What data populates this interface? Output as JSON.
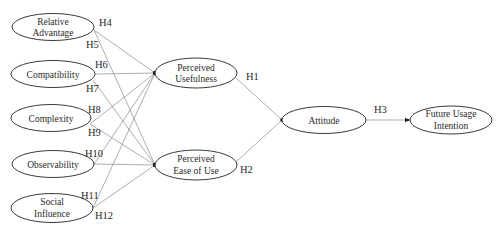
{
  "diagram": {
    "type": "structural-model",
    "colors": {
      "stroke": "#3a3a3a",
      "edge": "#8a8a8a",
      "text": "#2a2a2a",
      "background": "#ffffff"
    },
    "nodes": {
      "relative_advantage": {
        "lines": [
          "Relative",
          "Advantage"
        ]
      },
      "compatibility": {
        "lines": [
          "Compatibility"
        ]
      },
      "complexity": {
        "lines": [
          "Complexity"
        ]
      },
      "observability": {
        "lines": [
          "Observability"
        ]
      },
      "social_influence": {
        "lines": [
          "Social",
          "Influence"
        ]
      },
      "perceived_usefulness": {
        "lines": [
          "Perceived",
          "Usefulness"
        ]
      },
      "perceived_ease_of_use": {
        "lines": [
          "Perceived",
          "Ease of Use"
        ]
      },
      "attitude": {
        "lines": [
          "Attitude"
        ]
      },
      "future_usage_intention": {
        "lines": [
          "Future Usage",
          "Intention"
        ]
      }
    },
    "hypotheses": {
      "h1": "H1",
      "h2": "H2",
      "h3": "H3",
      "h4": "H4",
      "h5": "H5",
      "h6": "H6",
      "h7": "H7",
      "h8": "H8",
      "h9": "H9",
      "h10": "H10",
      "h11": "H11",
      "h12": "H12"
    },
    "edges": [
      {
        "from": "Relative Advantage",
        "to": "Perceived Usefulness",
        "label": "H4"
      },
      {
        "from": "Relative Advantage",
        "to": "Perceived Ease of Use",
        "label": "H5"
      },
      {
        "from": "Compatibility",
        "to": "Perceived Usefulness",
        "label": "H6"
      },
      {
        "from": "Compatibility",
        "to": "Perceived Ease of Use",
        "label": "H7"
      },
      {
        "from": "Complexity",
        "to": "Perceived Usefulness",
        "label": "H8"
      },
      {
        "from": "Complexity",
        "to": "Perceived Ease of Use",
        "label": "H9"
      },
      {
        "from": "Observability",
        "to": "Perceived Usefulness",
        "label": "H10"
      },
      {
        "from": "Observability",
        "to": "Perceived Ease of Use",
        "label": ""
      },
      {
        "from": "Social Influence",
        "to": "Perceived Usefulness",
        "label": "H11"
      },
      {
        "from": "Social Influence",
        "to": "Perceived Ease of Use",
        "label": "H12"
      },
      {
        "from": "Perceived Usefulness",
        "to": "Attitude",
        "label": "H1"
      },
      {
        "from": "Perceived Ease of Use",
        "to": "Attitude",
        "label": "H2"
      },
      {
        "from": "Attitude",
        "to": "Future Usage Intention",
        "label": "H3"
      }
    ]
  }
}
